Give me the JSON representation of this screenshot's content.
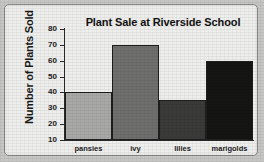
{
  "chart_data": {
    "type": "bar",
    "title": "Plant Sale at Riverside School",
    "xlabel": "",
    "ylabel": "Number of Plants Sold",
    "categories": [
      "pansies",
      "ivy",
      "lilies",
      "marigolds"
    ],
    "values": [
      40,
      70,
      35,
      60
    ],
    "bar_colors": [
      "#a9a9a7",
      "#6f6f6d",
      "#3b3b39",
      "#151513"
    ],
    "ytick_labels": [
      "80",
      "70",
      "60",
      "50",
      "40",
      "30",
      "20",
      "10"
    ],
    "yticks": [
      80,
      70,
      60,
      50,
      40,
      30,
      20,
      10
    ],
    "ylim": [
      10,
      80
    ],
    "grid": false,
    "legend": false,
    "axis_color": "#2b2b2b",
    "background_color": "#eeeeec"
  }
}
